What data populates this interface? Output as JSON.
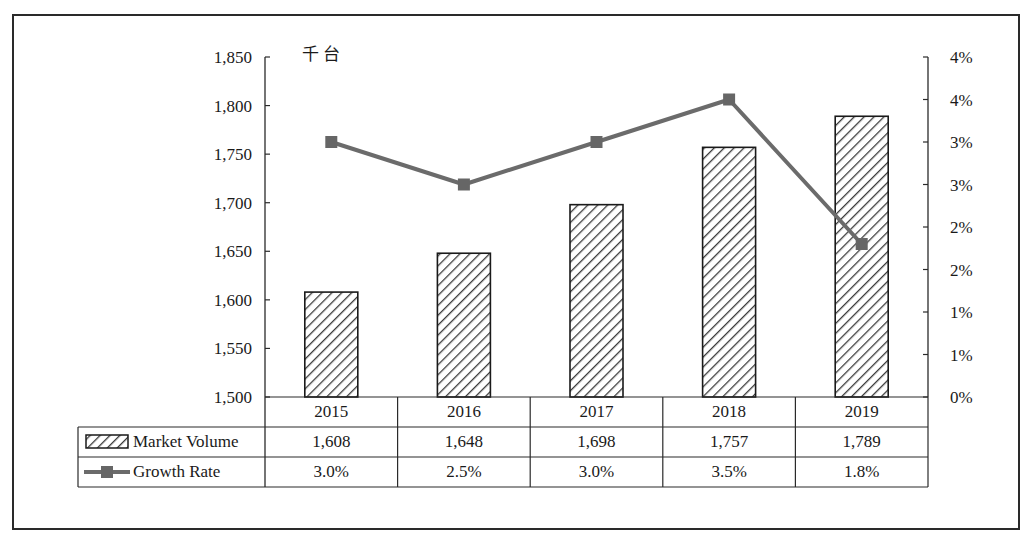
{
  "chart_data": {
    "type": "bar+line",
    "title": "",
    "unit_label": "千台",
    "categories": [
      "2015",
      "2016",
      "2017",
      "2018",
      "2019"
    ],
    "series": [
      {
        "name": "Market Volume",
        "type": "bar",
        "axis": "left",
        "pattern": "diagonal-hatch",
        "values": [
          1608,
          1648,
          1698,
          1757,
          1789
        ],
        "display": [
          "1,608",
          "1,648",
          "1,698",
          "1,757",
          "1,789"
        ]
      },
      {
        "name": "Growth Rate",
        "type": "line",
        "axis": "right",
        "marker": "square",
        "values": [
          3.0,
          2.5,
          3.0,
          3.5,
          1.8
        ],
        "display": [
          "3.0%",
          "2.5%",
          "3.0%",
          "3.5%",
          "1.8%"
        ]
      }
    ],
    "left_axis": {
      "ylim": [
        1500,
        1850
      ],
      "step": 50,
      "tick_labels": [
        "1,850",
        "1,800",
        "1,750",
        "1,700",
        "1,650",
        "1,600",
        "1,550",
        "1,500"
      ]
    },
    "right_axis": {
      "ylim": [
        0,
        4
      ],
      "step": 0.5,
      "tick_labels": [
        "4%",
        "4%",
        "3%",
        "3%",
        "2%",
        "2%",
        "1%",
        "1%",
        "0%"
      ]
    },
    "grid": false,
    "legend_position": "data-table",
    "colors": {
      "bar_stroke": "#1a1a1a",
      "bar_hatch": "#3a3a3a",
      "line": "#6b6b6b",
      "marker": "#666666"
    }
  },
  "table": {
    "rows": [
      {
        "label": "Market Volume",
        "legend": "hatched-bar-swatch"
      },
      {
        "label": "Growth Rate",
        "legend": "line-marker-swatch"
      }
    ]
  }
}
